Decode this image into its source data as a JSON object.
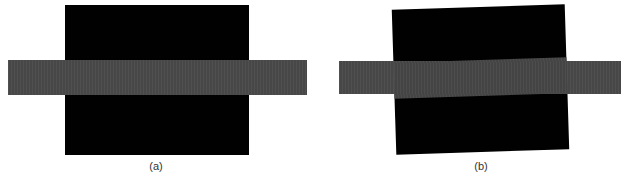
{
  "figure": {
    "panels": [
      {
        "id": "a",
        "caption": "(a)",
        "description": "Black square with a horizontal gray band crossing its middle, aligned",
        "colors": {
          "square": "#010101",
          "band": "#4a4a4a",
          "background": "#ffffff"
        }
      },
      {
        "id": "b",
        "caption": "(b)",
        "description": "Black square slightly rotated with a horizontal gray band crossing its middle",
        "colors": {
          "square": "#010101",
          "band": "#4a4a4a",
          "background": "#ffffff"
        }
      }
    ]
  }
}
